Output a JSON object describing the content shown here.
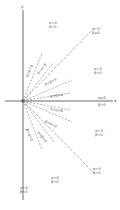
{
  "diagram": {
    "origin": {
      "x": 23,
      "y": 101
    },
    "axes": {
      "x_label": "x",
      "y_label": "y"
    },
    "colors": {
      "axis": "#444444",
      "line": "#777777",
      "text": "#555555"
    },
    "rays": [
      {
        "name": "ray-upper-main",
        "to": [
          92,
          30
        ],
        "dash": "3,1.5"
      },
      {
        "name": "ray-upper-2",
        "to": [
          72,
          80
        ],
        "dash": "2,1.5"
      },
      {
        "name": "ray-upper-3",
        "to": [
          70,
          93
        ],
        "dash": "2,1.5"
      },
      {
        "name": "ray-upper-4",
        "to": [
          42,
          53
        ],
        "dash": "2,1.5"
      },
      {
        "name": "ray-upper-5",
        "to": [
          54,
          62
        ],
        "dash": "2,1.5"
      },
      {
        "name": "ray-lower-main",
        "to": [
          93,
          172
        ],
        "dash": "3,1.5"
      },
      {
        "name": "ray-lower-2",
        "to": [
          72,
          122
        ],
        "dash": "2,1.5"
      },
      {
        "name": "ray-lower-3",
        "to": [
          70,
          110
        ],
        "dash": "2,1.5"
      },
      {
        "name": "ray-lower-4",
        "to": [
          42,
          150
        ],
        "dash": "2,1.5"
      },
      {
        "name": "ray-lower-5",
        "to": [
          54,
          142
        ],
        "dash": "2,1.5"
      }
    ],
    "labels": [
      {
        "x": 49,
        "y": 21,
        "lines": [
          "α<0",
          "β>0"
        ]
      },
      {
        "x": 92,
        "y": 27,
        "lines": [
          "α>0",
          "β=0"
        ]
      },
      {
        "x": 94,
        "y": 67,
        "lines": [
          "α>0",
          "β>0"
        ]
      },
      {
        "x": 98,
        "y": 96,
        "lines": [
          "α=0"
        ]
      },
      {
        "x": 98,
        "y": 103,
        "lines": [
          "β<0"
        ]
      },
      {
        "x": 95,
        "y": 129,
        "lines": [
          "α>0",
          "β<0"
        ]
      },
      {
        "x": 93,
        "y": 167,
        "lines": [
          "α<0",
          "β<0"
        ]
      },
      {
        "x": 51,
        "y": 176,
        "lines": [
          "α<0",
          "β<0"
        ]
      },
      {
        "x": 20,
        "y": 186,
        "lines": [
          "α<0",
          "β<0"
        ]
      }
    ],
    "rotated_labels": [
      {
        "x": 27,
        "y": 75,
        "angle": -68,
        "text": "0<β<α"
      },
      {
        "x": 38,
        "y": 72,
        "angle": -52,
        "text": "0<α<β"
      },
      {
        "x": 45,
        "y": 83,
        "angle": -28,
        "text": "0<β<α"
      },
      {
        "x": 50,
        "y": 95,
        "angle": -10,
        "text": "0>β>α"
      },
      {
        "x": 50,
        "y": 107,
        "angle": 10,
        "text": "0>α>β"
      },
      {
        "x": 45,
        "y": 119,
        "angle": 28,
        "text": "β<α<0"
      },
      {
        "x": 38,
        "y": 130,
        "angle": 52,
        "text": "α<β<0"
      },
      {
        "x": 27,
        "y": 127,
        "angle": 68,
        "text": "β<α<0"
      }
    ]
  }
}
